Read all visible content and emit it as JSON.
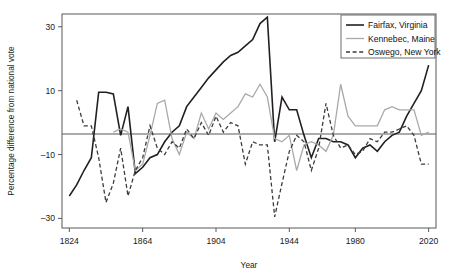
{
  "figure": {
    "background": "#ffffff",
    "frame_color": "#58595b",
    "zero_line_label": "zero-reference-line"
  },
  "axes": {
    "xlabel": "Year",
    "ylabel": "Percentage difference from national vote",
    "xticks": [
      "1824",
      "1864",
      "1904",
      "1944",
      "1980",
      "2020"
    ],
    "xtick_values": [
      1824,
      1864,
      1904,
      1944,
      1980,
      2020
    ],
    "yticks": [
      "30",
      "10",
      "–10",
      "–30"
    ],
    "ytick_values": [
      30,
      10,
      -10,
      -30
    ],
    "xlim": [
      1820,
      2024
    ],
    "ylim": [
      -33,
      34
    ]
  },
  "legend": {
    "position": "top-right",
    "entries": [
      {
        "label": "Fairfax, Virginia",
        "color": "#231f20",
        "style": "solid",
        "width": 1.6
      },
      {
        "label": "Kennebec, Maine",
        "color": "#a7a9ac",
        "style": "solid",
        "width": 1.3
      },
      {
        "label": "Oswego, New York",
        "color": "#3b3b3d",
        "style": "dashed",
        "width": 1.3
      }
    ]
  },
  "chart_data": {
    "type": "line",
    "title": "",
    "xlabel": "Year",
    "ylabel": "Percentage difference from national vote",
    "xlim": [
      1820,
      2024
    ],
    "ylim": [
      -33,
      34
    ],
    "grid": false,
    "legend_position": "top-right",
    "annotations": [
      "horizontal reference line at 0 (national vote)"
    ],
    "series": [
      {
        "name": "Fairfax, Virginia",
        "color": "#231f20",
        "style": "solid",
        "x": [
          1824,
          1828,
          1832,
          1836,
          1840,
          1844,
          1848,
          1852,
          1856,
          1860,
          1864,
          1868,
          1872,
          1876,
          1880,
          1884,
          1888,
          1892,
          1896,
          1900,
          1904,
          1908,
          1912,
          1916,
          1920,
          1924,
          1928,
          1932,
          1936,
          1940,
          1944,
          1948,
          1952,
          1956,
          1960,
          1964,
          1968,
          1972,
          1976,
          1980,
          1984,
          1988,
          1992,
          1996,
          2000,
          2004,
          2008,
          2012,
          2016,
          2020
        ],
        "y": [
          -23,
          -19.5,
          -15,
          -11,
          9.5,
          9.5,
          9,
          -4,
          5,
          -16,
          -14,
          -11,
          -10,
          -6,
          -3,
          -1,
          5,
          8,
          11,
          14,
          16.5,
          19,
          21,
          22,
          24,
          26,
          31,
          33,
          -6,
          8,
          4,
          4,
          -4,
          -11,
          -5,
          -5,
          -6,
          -6,
          -7,
          -11,
          -8,
          -7,
          -9,
          -6,
          -4,
          -3,
          2,
          6,
          10,
          18
        ]
      },
      {
        "name": "Kennebec, Maine",
        "color": "#a7a9ac",
        "style": "solid",
        "x": [
          1848,
          1852,
          1856,
          1860,
          1864,
          1868,
          1872,
          1876,
          1880,
          1884,
          1888,
          1892,
          1896,
          1900,
          1904,
          1908,
          1912,
          1916,
          1920,
          1924,
          1928,
          1932,
          1936,
          1940,
          1944,
          1948,
          1952,
          1956,
          1960,
          1964,
          1968,
          1972,
          1976,
          1980,
          1984,
          1988,
          1992,
          1996,
          2000,
          2004,
          2008,
          2012,
          2016,
          2020
        ],
        "y": [
          -3,
          -2,
          -3,
          -15,
          -13,
          -4,
          6,
          7,
          -5,
          -10,
          -3,
          -5,
          3,
          -2,
          3,
          1,
          3,
          5,
          9,
          8,
          12,
          8,
          -5,
          -6,
          -4,
          -15,
          -7,
          -6,
          -7,
          -9,
          -4,
          12,
          2,
          -1,
          -1,
          -1,
          -1,
          4,
          5,
          4,
          4,
          4,
          -4,
          -3
        ]
      },
      {
        "name": "Oswego, New York",
        "color": "#3b3b3d",
        "style": "dashed",
        "x": [
          1828,
          1832,
          1836,
          1840,
          1844,
          1848,
          1852,
          1856,
          1860,
          1864,
          1868,
          1872,
          1876,
          1880,
          1884,
          1888,
          1892,
          1896,
          1900,
          1904,
          1908,
          1912,
          1916,
          1920,
          1924,
          1928,
          1932,
          1936,
          1940,
          1944,
          1948,
          1952,
          1956,
          1960,
          1964,
          1968,
          1972,
          1976,
          1980,
          1984,
          1988,
          1992,
          1996,
          2000,
          2004,
          2008,
          2012,
          2016,
          2020
        ],
        "y": [
          7,
          -1,
          -1,
          -11,
          -25,
          -19,
          -8,
          -23,
          -15,
          -11,
          -1,
          -8,
          -10,
          -6,
          -8,
          -2,
          -5,
          0,
          -4,
          2,
          -3,
          0,
          -1,
          -13,
          -6,
          -7,
          -7,
          -29.5,
          -19,
          -9,
          -4,
          -6,
          -15,
          -8,
          6,
          -4,
          -8,
          -7,
          -10,
          -9,
          -5,
          -6,
          -3,
          -3,
          -2,
          -1,
          -4,
          -13,
          -13
        ]
      }
    ]
  }
}
